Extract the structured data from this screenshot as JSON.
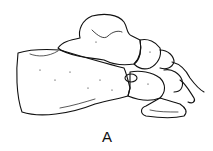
{
  "figure": {
    "label": "A",
    "stroke_color": "#111111",
    "background": "#ffffff"
  }
}
